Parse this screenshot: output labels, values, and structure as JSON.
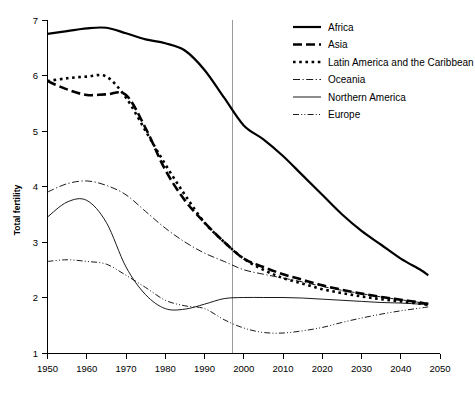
{
  "chart_data": {
    "type": "line",
    "title": "",
    "xlabel": "",
    "ylabel": "Total fertility",
    "xlim": [
      1950,
      2050
    ],
    "ylim": [
      1,
      7
    ],
    "grid": false,
    "legend_position": "top-right",
    "x_ticks": [
      "1950",
      "1960",
      "1970",
      "1980",
      "1990",
      "2000",
      "2010",
      "2020",
      "2030",
      "2040",
      "2050"
    ],
    "y_ticks": [
      "1",
      "2",
      "3",
      "4",
      "5",
      "6",
      "7"
    ],
    "annotations": [
      {
        "name": "projection-divider",
        "x": 2000,
        "label": ""
      }
    ],
    "x": [
      1950,
      1955,
      1960,
      1965,
      1970,
      1975,
      1980,
      1985,
      1990,
      1995,
      2000,
      2005,
      2010,
      2015,
      2020,
      2025,
      2030,
      2035,
      2040,
      2045,
      2047
    ],
    "series": [
      {
        "name": "Africa",
        "style": "solid-thick",
        "values": [
          6.75,
          6.8,
          6.85,
          6.86,
          6.76,
          6.65,
          6.58,
          6.45,
          6.1,
          5.6,
          5.1,
          4.85,
          4.55,
          4.2,
          3.85,
          3.5,
          3.2,
          2.95,
          2.7,
          2.5,
          2.4
        ]
      },
      {
        "name": "Asia",
        "style": "dashed-thick",
        "values": [
          5.9,
          5.75,
          5.65,
          5.66,
          5.65,
          5.05,
          4.3,
          3.75,
          3.35,
          3.0,
          2.7,
          2.55,
          2.42,
          2.32,
          2.22,
          2.14,
          2.07,
          2.01,
          1.96,
          1.91,
          1.88
        ]
      },
      {
        "name": "Latin America and the Caribbean",
        "style": "dotted-thick",
        "values": [
          5.9,
          5.95,
          5.98,
          5.98,
          5.6,
          5.0,
          4.4,
          3.85,
          3.35,
          3.0,
          2.7,
          2.5,
          2.35,
          2.25,
          2.15,
          2.08,
          2.02,
          1.97,
          1.93,
          1.89,
          1.86
        ]
      },
      {
        "name": "Oceania",
        "style": "dashdot-thin",
        "values": [
          3.9,
          4.05,
          4.1,
          4.02,
          3.85,
          3.55,
          3.25,
          3.0,
          2.8,
          2.65,
          2.5,
          2.42,
          2.35,
          2.28,
          2.2,
          2.13,
          2.07,
          2.01,
          1.96,
          1.91,
          1.9
        ]
      },
      {
        "name": "Northern America",
        "style": "solid-thin",
        "values": [
          3.45,
          3.72,
          3.75,
          3.35,
          2.55,
          2.05,
          1.8,
          1.79,
          1.88,
          1.98,
          2.0,
          2.0,
          2.0,
          1.99,
          1.97,
          1.95,
          1.93,
          1.91,
          1.9,
          1.88,
          1.87
        ]
      },
      {
        "name": "Europe",
        "style": "dashdotdot-thin",
        "values": [
          2.65,
          2.68,
          2.65,
          2.6,
          2.4,
          2.18,
          1.95,
          1.85,
          1.8,
          1.6,
          1.45,
          1.37,
          1.36,
          1.4,
          1.46,
          1.55,
          1.63,
          1.7,
          1.76,
          1.81,
          1.83
        ]
      }
    ]
  },
  "legend": {
    "entries": [
      {
        "label": "Africa",
        "style": "solid-thick"
      },
      {
        "label": "Asia",
        "style": "dashed-thick"
      },
      {
        "label": "Latin America and the Caribbean",
        "style": "dotted-thick"
      },
      {
        "label": "Oceania",
        "style": "dashdot-thin"
      },
      {
        "label": "Northern America",
        "style": "solid-thin"
      },
      {
        "label": "Europe",
        "style": "dashdotdot-thin"
      }
    ]
  },
  "axes": {
    "y_title": "Total fertility"
  }
}
